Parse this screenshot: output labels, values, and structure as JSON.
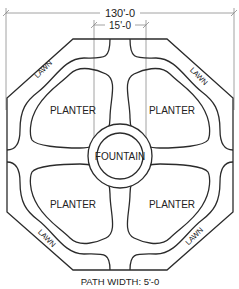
{
  "dimensions": {
    "overall": "130'-0",
    "path_spacing": "15'-0",
    "path_width": "PATH WIDTH: 5'-0"
  },
  "labels": {
    "fountain": "FOUNTAIN",
    "planters": [
      "PLANTER",
      "PLANTER",
      "PLANTER",
      "PLANTER"
    ],
    "lawns": [
      "LAWN",
      "LAWN",
      "LAWN",
      "LAWN"
    ]
  },
  "colors": {
    "line": "#2b2b2b",
    "dimension_line": "#8a8a8a",
    "background": "#ffffff"
  }
}
